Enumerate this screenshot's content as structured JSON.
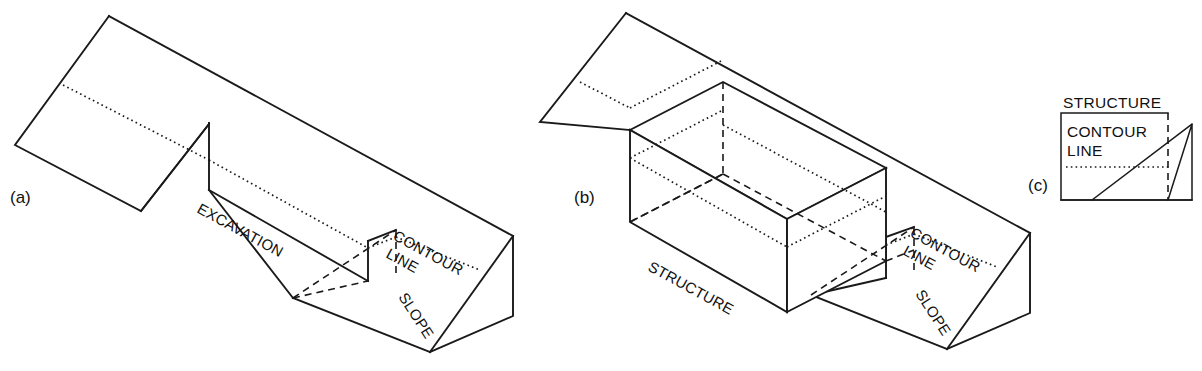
{
  "figure": {
    "background_color": "#ffffff",
    "line_color": "#1a1a1a"
  },
  "panels": [
    {
      "key": "a",
      "label": "(a)",
      "description": "Sloping terrain wedge with a rectangular excavation notch cut into the slope",
      "labels": {
        "excavation": "EXCAVATION",
        "contour_line_1": "CONTOUR",
        "contour_line_2": "LINE",
        "slope": "SLOPE"
      }
    },
    {
      "key": "b",
      "label": "(b)",
      "description": "Same sloping terrain wedge with a rectangular structure box set into the excavation",
      "labels": {
        "structure": "STRUCTURE",
        "contour_line_1": "CONTOUR",
        "contour_line_2": "LINE",
        "slope": "SLOPE"
      }
    },
    {
      "key": "c",
      "label": "(c)",
      "description": "Plan view of structure footprint with contour line crossing and slope section",
      "labels": {
        "structure": "STRUCTURE",
        "contour_line_1": "CONTOUR",
        "contour_line_2": "LINE"
      }
    }
  ],
  "line_styles": {
    "visible_edge": "solid",
    "contour_line": "dotted",
    "hidden_edge": "dashed"
  }
}
